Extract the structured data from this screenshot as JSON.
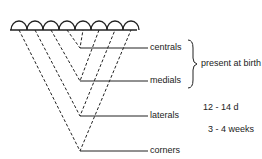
{
  "diagram": {
    "teeth": [
      "central",
      "central",
      "medial",
      "medial",
      "lateral",
      "lateral",
      "corner",
      "corner"
    ],
    "labels": {
      "centrals": "centrals",
      "medials": "medials",
      "laterals": "laterals",
      "corners": "corners"
    },
    "eruption": {
      "birth": "present at birth",
      "laterals": "12 - 14 d",
      "corners": "3 - 4 weeks"
    }
  }
}
